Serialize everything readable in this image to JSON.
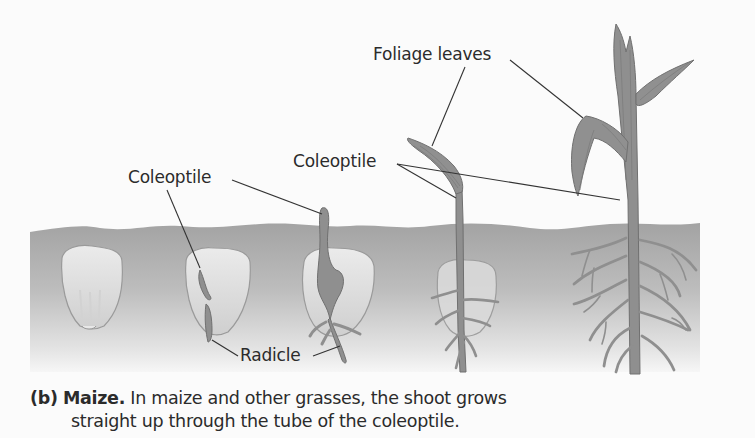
{
  "figure": {
    "labels": {
      "foliage_leaves": "Foliage leaves",
      "coleoptile_left": "Coleoptile",
      "coleoptile_right": "Coleoptile",
      "radicle": "Radicle"
    },
    "caption": {
      "part": "(b)",
      "title": "Maize.",
      "line1": "In maize and other grasses, the shoot grows",
      "line2": "straight up through the tube of the coleoptile."
    },
    "stages": [
      "kernel",
      "radicle-emerging",
      "coleoptile-emerging",
      "seedling-first-leaf",
      "seedling-foliage-leaves"
    ],
    "colors": {
      "plant": "#8f8f8f",
      "plant_outline": "#707070",
      "seed": "#dedede",
      "soil_top": "#a5a5a5",
      "soil_bottom": "#f2f2f2",
      "text": "#2b2b2b",
      "leader_line": "#333333"
    }
  }
}
